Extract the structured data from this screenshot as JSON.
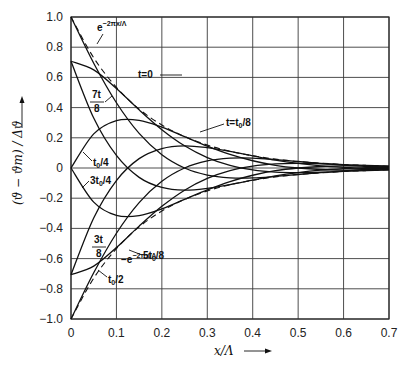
{
  "chart_data": {
    "type": "line",
    "title": "",
    "xlabel": "x/Λ",
    "ylabel": "(ϑ − ϑm) / Δϑ",
    "xlim": [
      0,
      0.7
    ],
    "ylim": [
      -1.0,
      1.0
    ],
    "grid": true,
    "x_ticks": [
      "0",
      "0.1",
      "0.2",
      "0.3",
      "0.4",
      "0.5",
      "0.6",
      "0.7"
    ],
    "y_ticks": [
      "1.0",
      "0.8",
      "0.6",
      "0.4",
      "0.2",
      "0",
      "-0.2",
      "-0.4",
      "-0.6",
      "-0.8",
      "-1.0"
    ],
    "x": [
      0,
      0.05,
      0.1,
      0.15,
      0.2,
      0.25,
      0.3,
      0.35,
      0.4,
      0.45,
      0.5,
      0.55,
      0.6,
      0.65,
      0.7
    ],
    "series": [
      {
        "name": "t=0",
        "values": [
          1.0,
          0.694,
          0.432,
          0.229,
          0.088,
          0.0,
          -0.047,
          -0.065,
          -0.066,
          -0.056,
          -0.043,
          -0.03,
          -0.019,
          -0.01,
          -0.004
        ]
      },
      {
        "name": "t=t0/8",
        "values": [
          0.707,
          0.65,
          0.527,
          0.385,
          0.254,
          0.147,
          0.069,
          0.017,
          -0.013,
          -0.027,
          -0.03,
          -0.028,
          -0.023,
          -0.017,
          -0.011
        ]
      },
      {
        "name": "t0/4",
        "values": [
          0.0,
          0.226,
          0.314,
          0.316,
          0.271,
          0.208,
          0.145,
          0.09,
          0.048,
          0.018,
          0.0,
          -0.01,
          -0.014,
          -0.014,
          -0.012
        ]
      },
      {
        "name": "3t0/8",
        "values": [
          -0.707,
          -0.331,
          -0.083,
          0.062,
          0.129,
          0.147,
          0.135,
          0.11,
          0.081,
          0.052,
          0.03,
          0.014,
          0.004,
          -0.003,
          -0.005
        ]
      },
      {
        "name": "t0/2",
        "values": [
          -1.0,
          -0.694,
          -0.432,
          -0.229,
          -0.088,
          0.0,
          0.047,
          0.065,
          0.066,
          0.056,
          0.043,
          0.03,
          0.019,
          0.01,
          0.004
        ]
      },
      {
        "name": "5t0/8",
        "values": [
          -0.707,
          -0.65,
          -0.527,
          -0.385,
          -0.254,
          -0.147,
          -0.069,
          -0.017,
          0.013,
          0.027,
          0.03,
          0.028,
          0.023,
          0.017,
          0.011
        ]
      },
      {
        "name": "3t0/4",
        "values": [
          0.0,
          -0.226,
          -0.314,
          -0.316,
          -0.271,
          -0.208,
          -0.145,
          -0.09,
          -0.048,
          -0.018,
          0.0,
          0.01,
          0.014,
          0.014,
          0.012
        ]
      },
      {
        "name": "7t0/8",
        "values": [
          0.707,
          0.331,
          0.083,
          -0.062,
          -0.129,
          -0.147,
          -0.135,
          -0.11,
          -0.081,
          -0.052,
          -0.03,
          -0.014,
          -0.004,
          0.003,
          0.005
        ]
      },
      {
        "name": "e^(-2πx/Λ)",
        "style": "dashed",
        "values": [
          1.0,
          0.73,
          0.534,
          0.39,
          0.285,
          0.208,
          0.152,
          0.111,
          0.081,
          0.059,
          0.043,
          0.032,
          0.023,
          0.017,
          0.012
        ]
      },
      {
        "name": "-e^(-2πx/Λ)",
        "style": "dashed",
        "values": [
          -1.0,
          -0.73,
          -0.534,
          -0.39,
          -0.285,
          -0.208,
          -0.152,
          -0.111,
          -0.081,
          -0.059,
          -0.043,
          -0.032,
          -0.023,
          -0.017,
          -0.012
        ]
      }
    ],
    "annotations": [
      {
        "text": "e^{-2πx/Λ}",
        "x": 0.065,
        "y": 0.66
      },
      {
        "text": "t=0",
        "x": 0.17,
        "y": 0.51
      },
      {
        "text": "7t0/8",
        "x": 0.05,
        "y": 0.43
      },
      {
        "text": "t=t0/8",
        "x": 0.37,
        "y": 0.24
      },
      {
        "text": "t0/4",
        "x": 0.05,
        "y": -0.01
      },
      {
        "text": "3t0/4",
        "x": 0.04,
        "y": -0.16
      },
      {
        "text": "3t0/8",
        "x": 0.055,
        "y": -0.52
      },
      {
        "text": "5t0/8",
        "x": 0.19,
        "y": -0.58
      },
      {
        "text": "-e^{-2πx/Λ}",
        "x": 0.12,
        "y": -0.63
      },
      {
        "text": "t0/2",
        "x": 0.09,
        "y": -0.73
      }
    ]
  },
  "labels": {
    "x_axis": "x/Λ",
    "y_axis": "(ϑ − ϑm) / Δϑ",
    "env_pos": "e",
    "env_pos_exp": "−2πx/Λ",
    "env_neg": "−e",
    "env_neg_exp": "−2πx/Λ",
    "t0": "t=0",
    "t1": "t=t",
    "t1_sub": "0",
    "t1_tail": "/8",
    "t7_num": "7t",
    "t7_den": "8",
    "t2": "t",
    "t2_tail": "/4",
    "t6": "3t",
    "t6_tail": "/4",
    "t3_num": "3t",
    "t3_den": "8",
    "t5": "5t",
    "t5_tail": "/8",
    "t4": "t",
    "t4_tail": "/2",
    "sub0": "0"
  }
}
